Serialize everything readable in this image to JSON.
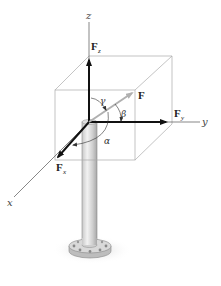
{
  "figure": {
    "axes": {
      "x": "x",
      "y": "y",
      "z": "z"
    },
    "vectors": {
      "F": {
        "label": "F",
        "sub": ""
      },
      "Fx": {
        "label": "F",
        "sub": "x"
      },
      "Fy": {
        "label": "F",
        "sub": "y"
      },
      "Fz": {
        "label": "F",
        "sub": "z"
      }
    },
    "angles": {
      "alpha": "α",
      "beta": "β",
      "gamma": "γ"
    },
    "caption": "",
    "colors": {
      "axis_line": "#555555",
      "box_line": "#aaaaaa",
      "component_vector": "#111111",
      "resultant_vector": "#b0b0b0",
      "pole": "#d6d6d6"
    }
  }
}
